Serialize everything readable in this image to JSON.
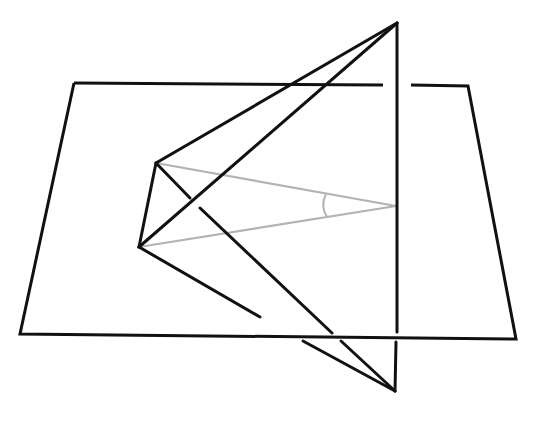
{
  "diagram": {
    "type": "solid-geometry",
    "colors": {
      "background": "#ffffff",
      "solid_line": "#111111",
      "projection_line": "#b3b3b3",
      "angle_arc": "#b3b3b3"
    },
    "stroke_widths": {
      "solid": 3,
      "projection": 2.2,
      "arc": 2
    },
    "points": {
      "plane_tl": [
        74,
        83
      ],
      "plane_tr": [
        468,
        86
      ],
      "plane_br": [
        516,
        339
      ],
      "plane_bl": [
        20,
        334
      ],
      "top": [
        397,
        23
      ],
      "bottom": [
        395,
        391
      ],
      "upper_left": [
        156,
        163
      ],
      "lower_left": [
        139,
        247
      ],
      "foot": [
        396,
        206
      ]
    },
    "plane": {
      "outline": [
        [
          74,
          83
        ],
        [
          383,
          85
        ]
      ],
      "outline_2": [
        [
          411,
          85
        ],
        [
          468,
          86
        ],
        [
          516,
          339
        ],
        [
          20,
          334
        ],
        [
          74,
          83
        ]
      ]
    },
    "segments": [
      {
        "name": "top-to-upper-left",
        "from": [
          397,
          23
        ],
        "to": [
          156,
          163
        ],
        "style": "solid"
      },
      {
        "name": "top-to-lower-left",
        "from": [
          397,
          23
        ],
        "to": [
          139,
          247
        ],
        "style": "solid"
      },
      {
        "name": "upper-left-to-lower-left",
        "from": [
          156,
          163
        ],
        "to": [
          139,
          247
        ],
        "style": "solid"
      },
      {
        "name": "vertical-top-part",
        "from": [
          397,
          23
        ],
        "to": [
          397,
          332
        ],
        "style": "solid"
      },
      {
        "name": "vertical-bottom-part",
        "from": [
          396,
          342
        ],
        "to": [
          395,
          391
        ],
        "style": "solid"
      },
      {
        "name": "upper-left-to-bottom-a",
        "from": [
          156,
          163
        ],
        "to": [
          190,
          198
        ],
        "style": "solid"
      },
      {
        "name": "upper-left-to-bottom-b",
        "from": [
          200,
          208
        ],
        "to": [
          332,
          333
        ],
        "style": "solid"
      },
      {
        "name": "upper-left-to-bottom-c",
        "from": [
          341,
          341
        ],
        "to": [
          395,
          391
        ],
        "style": "solid"
      },
      {
        "name": "lower-left-to-bottom-a",
        "from": [
          139,
          247
        ],
        "to": [
          260,
          317
        ],
        "style": "solid"
      },
      {
        "name": "lower-left-to-bottom-b",
        "from": [
          303,
          341
        ],
        "to": [
          395,
          391
        ],
        "style": "solid"
      }
    ],
    "projection_segments": [
      {
        "name": "upper-left-to-foot",
        "from": [
          156,
          163
        ],
        "to": [
          396,
          206
        ],
        "style": "gray"
      },
      {
        "name": "lower-left-to-foot",
        "from": [
          139,
          247
        ],
        "to": [
          396,
          206
        ],
        "style": "gray"
      }
    ],
    "angle_marker": {
      "name": "angle-at-foot",
      "vertex": [
        396,
        206
      ],
      "radius": 72,
      "path": "M 326 194 Q 320 206 327 217"
    }
  }
}
